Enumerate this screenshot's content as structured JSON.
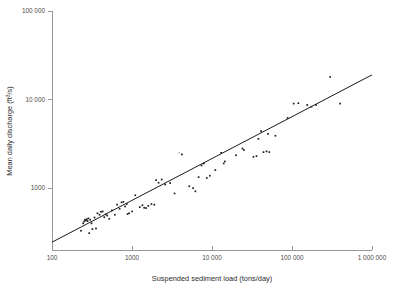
{
  "chart_data": {
    "type": "scatter",
    "title": "",
    "xlabel": "Suspended sediment load (tons/day)",
    "ylabel": "Mean daily discharge (ft3/s)",
    "ylabel_base": "Mean daily discharge (ft",
    "ylabel_sup": "3",
    "ylabel_tail": "/s)",
    "xscale": "log",
    "yscale": "log",
    "xlim": [
      100,
      1000000
    ],
    "ylim": [
      200,
      100000
    ],
    "grid": false,
    "legend": null,
    "xticks": [
      100,
      1000,
      10000,
      100000,
      1000000
    ],
    "xtick_labels": [
      "100",
      "1000",
      "10 000",
      "100 000",
      "1 000 000"
    ],
    "yticks": [
      1000,
      10000,
      100000
    ],
    "ytick_labels": [
      "1000",
      "10 000",
      "100 000"
    ],
    "series": [
      {
        "name": "observations",
        "marker": "square",
        "color": "#1d1d1d",
        "points": [
          [
            230,
            330
          ],
          [
            245,
            400
          ],
          [
            252,
            420
          ],
          [
            258,
            440
          ],
          [
            265,
            430
          ],
          [
            272,
            445
          ],
          [
            278,
            425
          ],
          [
            285,
            455
          ],
          [
            292,
            310
          ],
          [
            300,
            440
          ],
          [
            312,
            400
          ],
          [
            320,
            345
          ],
          [
            340,
            465
          ],
          [
            355,
            350
          ],
          [
            370,
            520
          ],
          [
            392,
            500
          ],
          [
            410,
            540
          ],
          [
            430,
            545
          ],
          [
            450,
            470
          ],
          [
            470,
            505
          ],
          [
            490,
            490
          ],
          [
            520,
            450
          ],
          [
            560,
            560
          ],
          [
            610,
            500
          ],
          [
            650,
            650
          ],
          [
            700,
            585
          ],
          [
            740,
            690
          ],
          [
            780,
            700
          ],
          [
            820,
            620
          ],
          [
            860,
            660
          ],
          [
            880,
            510
          ],
          [
            920,
            520
          ],
          [
            1000,
            545
          ],
          [
            1100,
            830
          ],
          [
            1250,
            610
          ],
          [
            1350,
            640
          ],
          [
            1420,
            600
          ],
          [
            1500,
            595
          ],
          [
            1600,
            630
          ],
          [
            1750,
            660
          ],
          [
            1900,
            650
          ],
          [
            2000,
            1230
          ],
          [
            2150,
            1150
          ],
          [
            2350,
            1250
          ],
          [
            2600,
            1100
          ],
          [
            3000,
            1140
          ],
          [
            3400,
            870
          ],
          [
            4200,
            2400
          ],
          [
            5200,
            1050
          ],
          [
            5800,
            1000
          ],
          [
            6200,
            920
          ],
          [
            6800,
            1330
          ],
          [
            7400,
            1800
          ],
          [
            7900,
            1900
          ],
          [
            8600,
            1300
          ],
          [
            9400,
            1380
          ],
          [
            11000,
            1600
          ],
          [
            13000,
            2500
          ],
          [
            14000,
            1900
          ],
          [
            14500,
            2000
          ],
          [
            20000,
            2350
          ],
          [
            24000,
            2800
          ],
          [
            25000,
            2700
          ],
          [
            33000,
            2250
          ],
          [
            36000,
            2300
          ],
          [
            38000,
            3600
          ],
          [
            41000,
            4400
          ],
          [
            44000,
            2550
          ],
          [
            48000,
            2600
          ],
          [
            50000,
            4100
          ],
          [
            52000,
            2550
          ],
          [
            62000,
            3900
          ],
          [
            88000,
            6200
          ],
          [
            105000,
            9000
          ],
          [
            120000,
            9100
          ],
          [
            155000,
            8700
          ],
          [
            175000,
            8300
          ],
          [
            200000,
            8700
          ],
          [
            300000,
            18000
          ],
          [
            400000,
            9000
          ]
        ]
      },
      {
        "name": "faint-outlier",
        "marker": "square",
        "color": "#bfbfbf",
        "points": [
          [
            3900,
            2500
          ]
        ]
      }
    ],
    "fit_line": {
      "name": "regression line",
      "color": "#1a1a1a",
      "x_start": 100,
      "y_start": 245,
      "x_end": 1000000,
      "y_end": 19000
    }
  }
}
